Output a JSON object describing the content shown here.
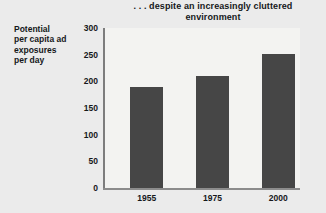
{
  "chart_data": {
    "type": "bar",
    "title": ". . . despite an increasingly cluttered environment",
    "title_lines": [
      ". . . despite an increasingly cluttered",
      "environment"
    ],
    "xlabel": "",
    "ylabel": "Potential per capita ad exposures per day",
    "ylabel_lines": [
      "Potential",
      "per capita ad",
      "exposures",
      "per day"
    ],
    "categories": [
      "1955",
      "1975",
      "2000"
    ],
    "values": [
      190,
      210,
      251
    ],
    "ylim": [
      0,
      300
    ],
    "yticks": [
      0,
      50,
      100,
      150,
      200,
      250,
      300
    ],
    "ytick_labels": [
      "0",
      "50",
      "100",
      "150",
      "200",
      "250",
      "300"
    ],
    "grid": false,
    "legend": null,
    "series": [
      {
        "name": "Potential per capita ad exposures per day",
        "values": [
          190,
          210,
          251
        ]
      }
    ],
    "colors": {
      "bar_fill": "#464646",
      "plot_background": "#f3f3f1",
      "page_background": "#ebebeb",
      "axis_line": "#8c8c8c",
      "text": "#15181a"
    }
  }
}
